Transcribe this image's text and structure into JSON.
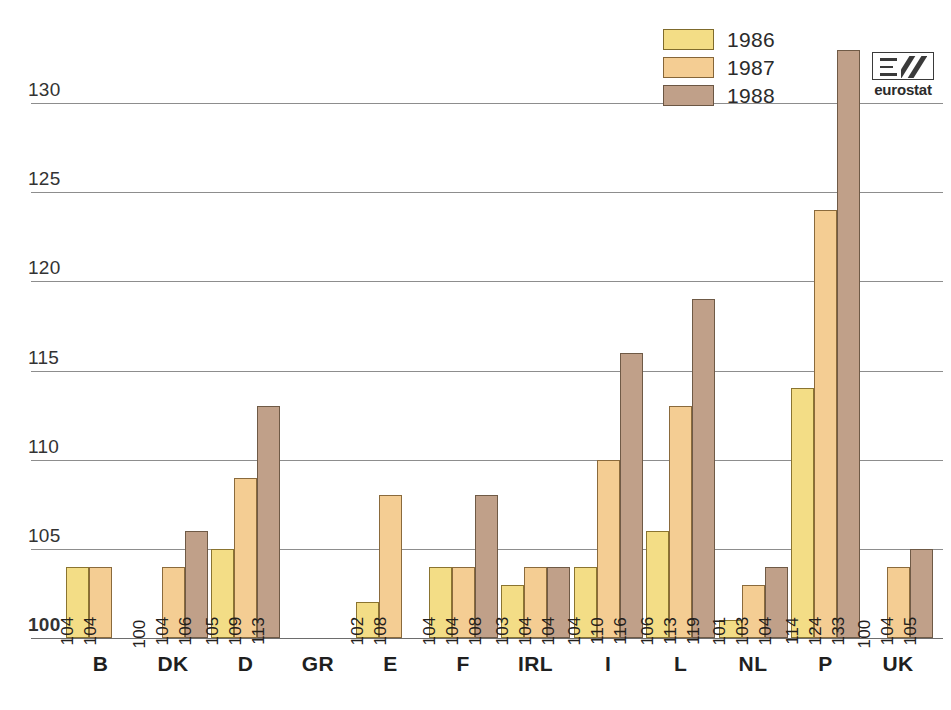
{
  "chart_data": {
    "type": "bar",
    "title": "",
    "xlabel": "",
    "ylabel": "",
    "ylim": [
      100,
      130
    ],
    "yticks": [
      100,
      105,
      110,
      115,
      120,
      125,
      130
    ],
    "grid": true,
    "legend_position": "top-right",
    "categories": [
      "B",
      "DK",
      "D",
      "GR",
      "E",
      "F",
      "IRL",
      "I",
      "L",
      "NL",
      "P",
      "UK"
    ],
    "series": [
      {
        "name": "1986",
        "color": "#f3dd86",
        "values": [
          104,
          100,
          105,
          null,
          102,
          104,
          103,
          104,
          106,
          101,
          114,
          100
        ]
      },
      {
        "name": "1987",
        "color": "#f4cd93",
        "values": [
          104,
          104,
          109,
          null,
          108,
          104,
          104,
          110,
          113,
          103,
          124,
          104
        ]
      },
      {
        "name": "1988",
        "color": "#c0a089",
        "values": [
          null,
          106,
          113,
          null,
          null,
          108,
          104,
          116,
          119,
          104,
          133,
          105
        ]
      }
    ]
  },
  "legend": {
    "items": [
      {
        "label": "1986",
        "series": "s1986"
      },
      {
        "label": "1987",
        "series": "s1987"
      },
      {
        "label": "1988",
        "series": "s1988"
      }
    ]
  },
  "logo": {
    "text": "eurostat"
  }
}
